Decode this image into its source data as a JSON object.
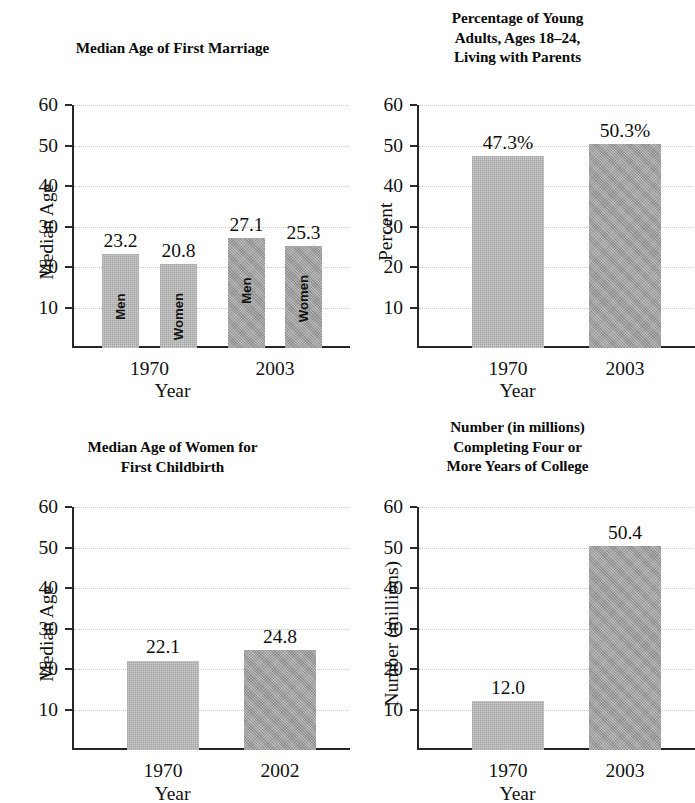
{
  "figure": {
    "background": "#ffffff",
    "bar_color_light": "#b2b2b2",
    "bar_color_dark": "#a3a3a3",
    "axis_color": "#262626",
    "gridline_color": "#c9c9c9"
  },
  "chart_data": [
    {
      "id": "median-age-first-marriage",
      "type": "bar",
      "title": "Median Age of First Marriage",
      "title_lines": [
        "Median Age of First Marriage"
      ],
      "xlabel": "Year",
      "ylabel": "Median Age",
      "ylim": [
        0,
        60
      ],
      "yticks": [
        10,
        20,
        30,
        40,
        50,
        60
      ],
      "ytick_labels": [
        "10",
        "20",
        "30",
        "40",
        "50",
        "60"
      ],
      "grid": true,
      "legend": "none",
      "categories": [
        "1970",
        "2003"
      ],
      "bars": [
        {
          "group": "1970",
          "series": "Men",
          "value": 23.2,
          "label": "23.2",
          "inner_label": "Men",
          "shade": "light"
        },
        {
          "group": "1970",
          "series": "Women",
          "value": 20.8,
          "label": "20.8",
          "inner_label": "Women",
          "shade": "light"
        },
        {
          "group": "2003",
          "series": "Men",
          "value": 27.1,
          "label": "27.1",
          "inner_label": "Men",
          "shade": "dark"
        },
        {
          "group": "2003",
          "series": "Women",
          "value": 25.3,
          "label": "25.3",
          "inner_label": "Women",
          "shade": "dark"
        }
      ]
    },
    {
      "id": "young-adults-living-with-parents",
      "type": "bar",
      "title": "Percentage of Young Adults, Ages 18–24, Living with Parents",
      "title_lines": [
        "Percentage of Young",
        "Adults, Ages 18–24,",
        "Living with Parents"
      ],
      "xlabel": "Year",
      "ylabel": "Percent",
      "ylim": [
        0,
        60
      ],
      "yticks": [
        10,
        20,
        30,
        40,
        50,
        60
      ],
      "ytick_labels": [
        "10",
        "20",
        "30",
        "40",
        "50",
        "60"
      ],
      "grid": true,
      "legend": "none",
      "categories": [
        "1970",
        "2003"
      ],
      "bars": [
        {
          "group": "1970",
          "series": "",
          "value": 47.3,
          "label": "47.3%",
          "inner_label": "",
          "shade": "light"
        },
        {
          "group": "2003",
          "series": "",
          "value": 50.3,
          "label": "50.3%",
          "inner_label": "",
          "shade": "dark"
        }
      ]
    },
    {
      "id": "median-age-women-first-childbirth",
      "type": "bar",
      "title": "Median Age of Women for First Childbirth",
      "title_lines": [
        "Median Age of Women for",
        "First Childbirth"
      ],
      "xlabel": "Year",
      "ylabel": "Median Age",
      "ylim": [
        0,
        60
      ],
      "yticks": [
        10,
        20,
        30,
        40,
        50,
        60
      ],
      "ytick_labels": [
        "10",
        "20",
        "30",
        "40",
        "50",
        "60"
      ],
      "grid": true,
      "legend": "none",
      "categories": [
        "1970",
        "2002"
      ],
      "bars": [
        {
          "group": "1970",
          "series": "",
          "value": 22.1,
          "label": "22.1",
          "inner_label": "",
          "shade": "light"
        },
        {
          "group": "2002",
          "series": "",
          "value": 24.8,
          "label": "24.8",
          "inner_label": "",
          "shade": "dark"
        }
      ]
    },
    {
      "id": "completing-four-or-more-years-college",
      "type": "bar",
      "title": "Number (in millions) Completing Four or More Years of College",
      "title_lines": [
        "Number (in millions)",
        "Completing Four or",
        "More Years of College"
      ],
      "xlabel": "Year",
      "ylabel": "Number (millions)",
      "ylim": [
        0,
        60
      ],
      "yticks": [
        10,
        20,
        30,
        40,
        50,
        60
      ],
      "ytick_labels": [
        "10",
        "20",
        "30",
        "40",
        "50",
        "60"
      ],
      "grid": true,
      "legend": "none",
      "categories": [
        "1970",
        "2003"
      ],
      "bars": [
        {
          "group": "1970",
          "series": "",
          "value": 12.0,
          "label": "12.0",
          "inner_label": "",
          "shade": "light"
        },
        {
          "group": "2003",
          "series": "",
          "value": 50.4,
          "label": "50.4",
          "inner_label": "",
          "shade": "dark"
        }
      ]
    }
  ]
}
